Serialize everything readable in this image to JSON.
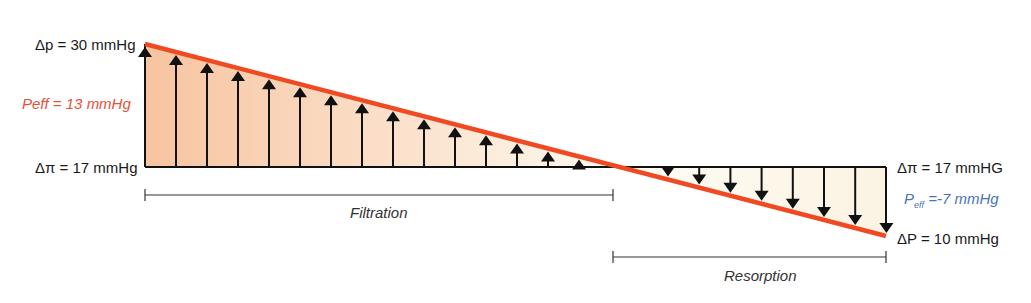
{
  "labels": {
    "dp_left": "Δp = 30 mmHg",
    "peff_left": "Peff = 13 mmHg",
    "dpi_left": "Δπ = 17 mmHg",
    "dpi_right": "Δπ = 17 mmHG",
    "peff_right_main": "P",
    "peff_right_sub": "eff",
    "peff_right_rest": " =-7 mmHg",
    "dp_right": "ΔP = 10 mmHg",
    "filtration": "Filtration",
    "resorption": "Resorption"
  },
  "colors": {
    "pressure_line": "#f04a23",
    "peff_positive": "#e8503a",
    "peff_negative": "#4a74b8",
    "fill_start": "#f7c6a0",
    "fill_end": "#fdf6e8"
  }
}
